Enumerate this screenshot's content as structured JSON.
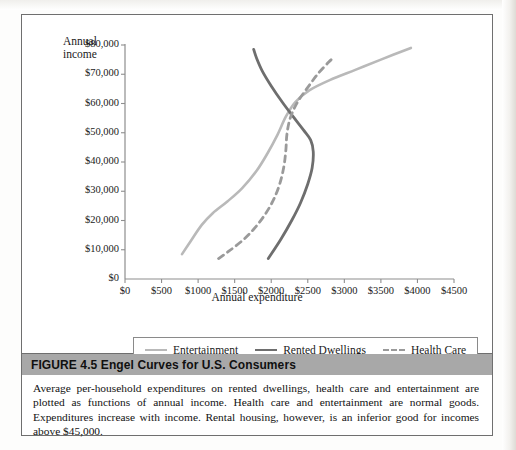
{
  "figure": {
    "label": "FIGURE 4.5",
    "title": "FIGURE 4.5  Engel Curves for U.S. Consumers",
    "caption": "Average per-household expenditures on rented dwellings, health care and entertainment are plotted as functions of annual income. Health care and entertainment are normal goods. Expenditures increase with income. Rental housing, however, is an inferior good for incomes above $45,000."
  },
  "legend": {
    "items": [
      {
        "label": "Entertainment",
        "color": "#b9b9b9",
        "style": "solid"
      },
      {
        "label": "Rented Dwellings",
        "color": "#6e6e6e",
        "style": "solid"
      },
      {
        "label": "Health Care",
        "color": "#9a9a9a",
        "style": "dashed"
      }
    ]
  },
  "chart_data": {
    "type": "line",
    "title": "Engel Curves for U.S. Consumers",
    "xlabel": "Annual expenditure",
    "ylabel": "Annual income",
    "ylabel_line1": "Annual",
    "ylabel_line2": "income",
    "xlim": [
      0,
      4500
    ],
    "ylim": [
      0,
      80000
    ],
    "xticks": [
      0,
      500,
      1000,
      1500,
      2000,
      2500,
      3000,
      3500,
      4000,
      4500
    ],
    "xtick_labels": [
      "$0",
      "$500",
      "$1000",
      "$1500",
      "$2000",
      "$2500",
      "$3000",
      "$3500",
      "$4000",
      "$4500"
    ],
    "yticks": [
      0,
      10000,
      20000,
      30000,
      40000,
      50000,
      60000,
      70000,
      80000
    ],
    "ytick_labels": [
      "$0",
      "$10,000",
      "$20,000",
      "$30,000",
      "$40,000",
      "$50,000",
      "$60,000",
      "$70,000",
      "$80,000"
    ],
    "grid": false,
    "legend_position": "below-axes",
    "orientation": "income-on-y-axis",
    "series": [
      {
        "name": "Entertainment",
        "color": "#b9b9b9",
        "style": "solid",
        "width": 2.6,
        "points": [
          [
            780,
            8500
          ],
          [
            900,
            13000
          ],
          [
            1050,
            18500
          ],
          [
            1200,
            22500
          ],
          [
            1400,
            26500
          ],
          [
            1600,
            31000
          ],
          [
            1800,
            37000
          ],
          [
            1950,
            43000
          ],
          [
            2080,
            49000
          ],
          [
            2200,
            55500
          ],
          [
            2330,
            60500
          ],
          [
            2520,
            64500
          ],
          [
            2800,
            68000
          ],
          [
            3150,
            71500
          ],
          [
            3500,
            75000
          ],
          [
            3910,
            79000
          ]
        ]
      },
      {
        "name": "Rented Dwellings",
        "color": "#6e6e6e",
        "style": "solid",
        "width": 2.8,
        "points": [
          [
            1960,
            7000
          ],
          [
            2130,
            13500
          ],
          [
            2280,
            20000
          ],
          [
            2400,
            26000
          ],
          [
            2500,
            32500
          ],
          [
            2560,
            38000
          ],
          [
            2575,
            43500
          ],
          [
            2540,
            47500
          ],
          [
            2440,
            51000
          ],
          [
            2300,
            55500
          ],
          [
            2150,
            60500
          ],
          [
            2000,
            66000
          ],
          [
            1880,
            71000
          ],
          [
            1800,
            75500
          ],
          [
            1760,
            78500
          ]
        ]
      },
      {
        "name": "Health Care",
        "color": "#9a9a9a",
        "style": "dashed",
        "width": 2.8,
        "dasharray": "6,5",
        "points": [
          [
            1280,
            7000
          ],
          [
            1420,
            9500
          ],
          [
            1600,
            13000
          ],
          [
            1760,
            17000
          ],
          [
            1900,
            21500
          ],
          [
            2020,
            26500
          ],
          [
            2110,
            32000
          ],
          [
            2170,
            38000
          ],
          [
            2200,
            44000
          ],
          [
            2215,
            49500
          ],
          [
            2260,
            55000
          ],
          [
            2360,
            60500
          ],
          [
            2500,
            65500
          ],
          [
            2650,
            70500
          ],
          [
            2820,
            75000
          ]
        ]
      }
    ]
  }
}
